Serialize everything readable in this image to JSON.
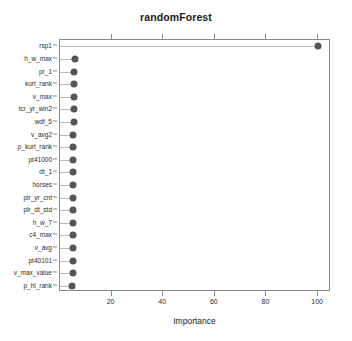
{
  "chart_data": {
    "type": "bar",
    "title": "randomForest",
    "xlabel": "Importance",
    "ylabel": "",
    "xlim": [
      0,
      105
    ],
    "xticks": [
      20,
      40,
      60,
      80,
      100
    ],
    "xtick_labels": [
      "20",
      "40",
      "60",
      "80",
      "100"
    ],
    "grid": false,
    "legend": null,
    "orientation": "horizontal",
    "style": "dotchart",
    "marker_color": "#555557",
    "line_color": "#b9b9b9",
    "axis_color": "#8a8a8a",
    "categories": [
      "rsp1",
      "h_w_max",
      "pr_1",
      "kurt_rank",
      "v_max",
      "tcr_yr_win2",
      "wdf_5",
      "v_avg2",
      "p_kurt_rank",
      "pt41000",
      "dt_1",
      "horses",
      "plr_yr_cnt",
      "plr_dt_std",
      "h_w_7",
      "c4_max",
      "v_avg",
      "pt40101",
      "v_max_value",
      "p_hl_rank"
    ],
    "values": [
      100.0,
      5.8,
      5.6,
      5.6,
      5.4,
      5.3,
      5.3,
      5.2,
      5.2,
      5.2,
      5.1,
      5.1,
      5.1,
      5.0,
      5.0,
      5.0,
      4.9,
      4.9,
      4.9,
      4.8
    ]
  }
}
